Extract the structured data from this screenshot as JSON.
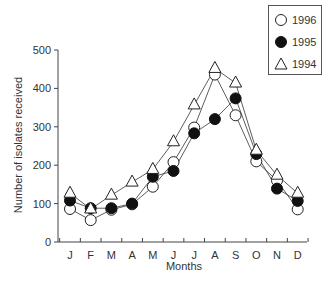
{
  "chart_data": {
    "type": "line",
    "title": "",
    "xlabel": "Months",
    "ylabel": "Number of isolates received",
    "categories": [
      "J",
      "F",
      "M",
      "A",
      "M",
      "J",
      "J",
      "A",
      "S",
      "O",
      "N",
      "D"
    ],
    "ylim": [
      0,
      500
    ],
    "yticks": [
      0,
      100,
      200,
      300,
      400,
      500
    ],
    "grid": false,
    "legend_position": "top-right",
    "series": [
      {
        "name": "1996",
        "marker": "open-circle",
        "values": [
          86,
          57,
          84,
          98,
          144,
          208,
          298,
          436,
          330,
          210,
          160,
          85
        ]
      },
      {
        "name": "1995",
        "marker": "filled-circle",
        "values": [
          108,
          88,
          88,
          100,
          170,
          185,
          283,
          320,
          374,
          229,
          139,
          107
        ]
      },
      {
        "name": "1994",
        "marker": "open-triangle",
        "values": [
          127,
          86,
          122,
          156,
          189,
          261,
          357,
          452,
          414,
          239,
          174,
          127
        ]
      }
    ]
  },
  "legend": {
    "items": [
      {
        "label": "1996"
      },
      {
        "label": "1995"
      },
      {
        "label": "1994"
      }
    ]
  },
  "axes": {
    "ylabel": "Number of isolates received",
    "xlabel": "Months"
  }
}
